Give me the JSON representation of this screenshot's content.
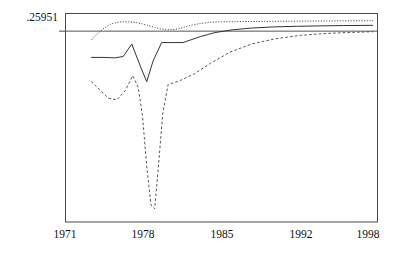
{
  "chart_data": {
    "type": "line",
    "title": "",
    "xlabel": "",
    "ylabel": "",
    "yticks": [
      ".25951"
    ],
    "ytick_values": [
      0.25951
    ],
    "xticks": [
      "1971",
      "1978",
      "1985",
      "1992",
      "1998"
    ],
    "xtick_values": [
      1971,
      1978,
      1985,
      1992,
      1998
    ],
    "xlim": [
      1970.0,
      1999.2
    ],
    "ylim": [
      0.0,
      0.2835
    ],
    "grid": false,
    "legend": "none",
    "reference_line": {
      "name": "reference-line",
      "y": 0.25951,
      "style": "solid",
      "color": "#555555"
    },
    "series": [
      {
        "name": "upper-band",
        "style": "dotted",
        "color": "#444444",
        "x": [
          1972.4,
          1973.0,
          1973.6,
          1974.2,
          1974.8,
          1975.4,
          1976.0,
          1976.6,
          1977.2,
          1977.8,
          1978.4,
          1979.0,
          1979.6,
          1980.2,
          1980.8,
          1981.6,
          1982.6,
          1983.6,
          1984.6,
          1985.6,
          1987.0,
          1989.0,
          1991.0,
          1993.0,
          1995.0,
          1997.0,
          1998.8
        ],
        "y": [
          0.2473,
          0.2562,
          0.2635,
          0.2689,
          0.2714,
          0.2722,
          0.2721,
          0.2712,
          0.2694,
          0.2669,
          0.2643,
          0.2622,
          0.2613,
          0.2618,
          0.2636,
          0.2669,
          0.2699,
          0.2716,
          0.2722,
          0.2724,
          0.2726,
          0.2728,
          0.273,
          0.2732,
          0.2734,
          0.2736,
          0.2737
        ]
      },
      {
        "name": "central-estimate",
        "style": "solid",
        "color": "#333333",
        "x": [
          1972.4,
          1973.6,
          1974.6,
          1975.4,
          1976.2,
          1977.0,
          1977.6,
          1978.2,
          1979.0,
          1979.8,
          1981.0,
          1982.6,
          1984.0,
          1985.6,
          1987.4,
          1989.4,
          1991.6,
          1993.8,
          1996.0,
          1998.8
        ],
        "y": [
          0.2238,
          0.2238,
          0.2232,
          0.225,
          0.242,
          0.212,
          0.1908,
          0.219,
          0.244,
          0.244,
          0.244,
          0.252,
          0.2576,
          0.2613,
          0.2637,
          0.2652,
          0.2661,
          0.2667,
          0.2671,
          0.2674
        ]
      },
      {
        "name": "lower-band",
        "style": "dashed",
        "color": "#555555",
        "x": [
          1972.4,
          1973.2,
          1974.0,
          1974.8,
          1975.6,
          1976.3,
          1976.8,
          1977.2,
          1977.6,
          1978.0,
          1978.35,
          1978.7,
          1979.1,
          1979.6,
          1980.6,
          1982.0,
          1983.6,
          1985.4,
          1987.4,
          1989.6,
          1992.0,
          1994.4,
          1996.8,
          1998.8
        ],
        "y": [
          0.1911,
          0.18,
          0.1685,
          0.166,
          0.179,
          0.199,
          0.183,
          0.145,
          0.076,
          0.023,
          0.018,
          0.076,
          0.147,
          0.187,
          0.1915,
          0.201,
          0.216,
          0.231,
          0.242,
          0.249,
          0.2538,
          0.2564,
          0.2578,
          0.2588
        ]
      }
    ]
  },
  "axes": {
    "frame_color": "#4a4a4a",
    "background": "#ffffff"
  }
}
